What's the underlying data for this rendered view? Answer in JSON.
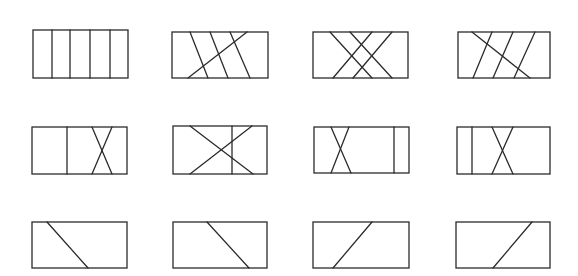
{
  "diagram": {
    "stroke_color": "#2b2b2b",
    "background": "#ffffff",
    "figures": [
      {
        "id": "r1c1",
        "rect": [
          33,
          30,
          95,
          48
        ],
        "lines": [
          [
            52,
            30,
            52,
            78
          ],
          [
            70,
            30,
            70,
            78
          ],
          [
            90,
            30,
            90,
            78
          ],
          [
            110,
            30,
            110,
            78
          ]
        ]
      },
      {
        "id": "r1c2",
        "rect": [
          172,
          32,
          96,
          46
        ],
        "lines": [
          [
            190,
            32,
            208,
            78
          ],
          [
            210,
            32,
            228,
            78
          ],
          [
            230,
            32,
            250,
            78
          ],
          [
            247,
            32,
            188,
            78
          ]
        ]
      },
      {
        "id": "r1c3",
        "rect": [
          313,
          32,
          95,
          46
        ],
        "lines": [
          [
            330,
            32,
            372,
            78
          ],
          [
            350,
            32,
            392,
            78
          ],
          [
            372,
            32,
            333,
            78
          ],
          [
            392,
            32,
            353,
            78
          ]
        ]
      },
      {
        "id": "r1c4",
        "rect": [
          458,
          32,
          92,
          46
        ],
        "lines": [
          [
            492,
            32,
            473,
            78
          ],
          [
            513,
            32,
            493,
            78
          ],
          [
            535,
            32,
            514,
            78
          ],
          [
            472,
            32,
            530,
            78
          ]
        ]
      },
      {
        "id": "r2c1",
        "rect": [
          32,
          127,
          95,
          47
        ],
        "lines": [
          [
            67,
            127,
            67,
            174
          ],
          [
            92,
            127,
            112,
            174
          ],
          [
            112,
            127,
            92,
            174
          ]
        ]
      },
      {
        "id": "r2c2",
        "rect": [
          173,
          126,
          94,
          48
        ],
        "lines": [
          [
            232,
            126,
            232,
            174
          ],
          [
            190,
            126,
            253,
            174
          ],
          [
            252,
            126,
            190,
            174
          ]
        ]
      },
      {
        "id": "r2c3",
        "rect": [
          314,
          127,
          95,
          46
        ],
        "lines": [
          [
            394,
            127,
            394,
            173
          ],
          [
            331,
            127,
            351,
            173
          ],
          [
            349,
            127,
            331,
            173
          ]
        ]
      },
      {
        "id": "r2c4",
        "rect": [
          457,
          127,
          93,
          47
        ],
        "lines": [
          [
            472,
            127,
            472,
            174
          ],
          [
            492,
            127,
            513,
            174
          ],
          [
            513,
            127,
            492,
            174
          ]
        ]
      },
      {
        "id": "r3c1",
        "rect": [
          32,
          222,
          95,
          46
        ],
        "lines": [
          [
            47,
            222,
            88,
            268
          ]
        ]
      },
      {
        "id": "r3c2",
        "rect": [
          173,
          222,
          94,
          46
        ],
        "lines": [
          [
            207,
            222,
            249,
            268
          ]
        ]
      },
      {
        "id": "r3c3",
        "rect": [
          313,
          222,
          96,
          46
        ],
        "lines": [
          [
            372,
            222,
            333,
            268
          ]
        ]
      },
      {
        "id": "r3c4",
        "rect": [
          456,
          222,
          94,
          46
        ],
        "lines": [
          [
            532,
            222,
            493,
            268
          ]
        ]
      }
    ]
  }
}
